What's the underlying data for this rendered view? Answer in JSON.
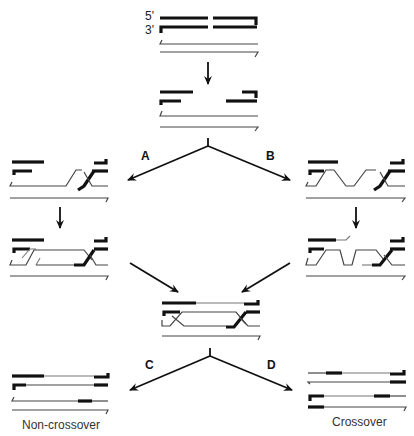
{
  "diagram": {
    "type": "DNA double-strand break repair pathway",
    "strand_labels": {
      "five_prime": "5'",
      "three_prime": "3'"
    },
    "steps": {
      "A": "A",
      "B": "B",
      "C": "C",
      "D": "D"
    },
    "outcomes": {
      "left": "Non-crossover",
      "right": "Crossover"
    },
    "stages": [
      "double-strand break",
      "end resection",
      "strand invasion (A)",
      "second-end capture (B)",
      "DNA synthesis",
      "double Holliday junction",
      "resolution"
    ],
    "colors": {
      "parental_strand": "#111111",
      "template_strand": "#444444",
      "new_synthesis": "#777777"
    }
  }
}
